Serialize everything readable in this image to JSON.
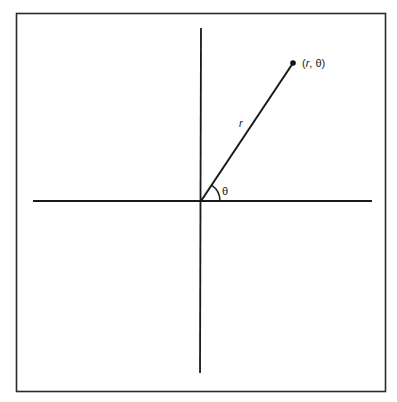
{
  "diagram": {
    "type": "polar-coordinates",
    "frame": {
      "x": 16,
      "y": 13,
      "width": 370,
      "height": 379,
      "stroke": "#2a2a2a"
    },
    "origin": {
      "x": 201,
      "y": 201
    },
    "axes": {
      "horizontal": {
        "x1": 33,
        "x2": 372,
        "y": 201
      },
      "vertical": {
        "x": 201,
        "y1": 28,
        "y2": 373
      },
      "stroke": "#1a1a1a"
    },
    "point": {
      "x": 293,
      "y": 63,
      "label": "(r, θ)",
      "label_r": "r",
      "label_rest": ", θ)",
      "label_open": "("
    },
    "radius_label": "r",
    "angle_label": "θ",
    "angle_arc_radius": 19
  }
}
